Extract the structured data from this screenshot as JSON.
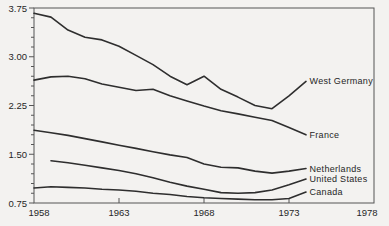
{
  "figure": {
    "background_color": "#f3f2f0",
    "line_color": "#2e2e2e",
    "axis_color": "#555555",
    "text_color": "#262626"
  },
  "chart_data": {
    "type": "line",
    "title": "",
    "xlabel": "",
    "ylabel": "",
    "grid": false,
    "legend_position": "right-end-labels",
    "xlim": [
      1958,
      1978
    ],
    "ylim": [
      0.75,
      3.75
    ],
    "x_ticks": [
      1958,
      1963,
      1968,
      1973,
      1978
    ],
    "y_ticks": [
      "3.75",
      "3.00",
      "2.25",
      "1.50",
      "0.75"
    ],
    "y_tick_values": [
      3.75,
      3.0,
      2.25,
      1.5,
      0.75
    ],
    "y_minor_step": 0.15,
    "x": [
      1958,
      1959,
      1960,
      1961,
      1962,
      1963,
      1964,
      1965,
      1966,
      1967,
      1968,
      1969,
      1970,
      1971,
      1972,
      1973,
      1974
    ],
    "series": [
      {
        "name": "West Germany",
        "values": [
          3.67,
          3.61,
          3.41,
          3.3,
          3.26,
          3.16,
          3.02,
          2.88,
          2.7,
          2.57,
          2.7,
          2.5,
          2.38,
          2.25,
          2.2,
          2.4,
          2.62
        ]
      },
      {
        "name": "France",
        "values": [
          2.64,
          2.69,
          2.7,
          2.66,
          2.58,
          2.53,
          2.48,
          2.5,
          2.4,
          2.32,
          2.24,
          2.17,
          2.12,
          2.07,
          2.02,
          1.91,
          1.8
        ]
      },
      {
        "name": "Netherlands",
        "values": [
          1.87,
          1.83,
          1.79,
          1.74,
          1.69,
          1.64,
          1.59,
          1.54,
          1.49,
          1.45,
          1.35,
          1.3,
          1.29,
          1.24,
          1.21,
          1.24,
          1.28
        ]
      },
      {
        "name": "United States",
        "values": [
          null,
          1.4,
          1.37,
          1.33,
          1.29,
          1.25,
          1.2,
          1.14,
          1.07,
          1.01,
          0.96,
          0.91,
          0.9,
          0.91,
          0.95,
          1.03,
          1.12
        ]
      },
      {
        "name": "Canada",
        "values": [
          0.98,
          1.0,
          0.99,
          0.98,
          0.96,
          0.95,
          0.93,
          0.9,
          0.88,
          0.85,
          0.83,
          0.82,
          0.81,
          0.8,
          0.8,
          0.82,
          0.92
        ]
      }
    ]
  }
}
